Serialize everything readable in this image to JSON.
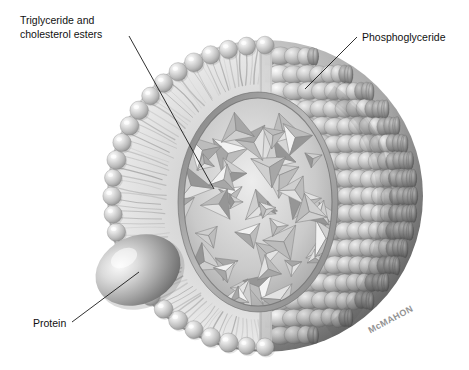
{
  "figure": {
    "background_color": "#ffffff",
    "width": 469,
    "height": 370
  },
  "labels": [
    {
      "id": "triglyceride",
      "name": "triglyceride-and-cholesterol-esters-label",
      "line1": "Triglyceride and",
      "line2": "cholesterol esters",
      "text_x": 20,
      "text_y": 24,
      "line_from_x": 129,
      "line_from_y": 36,
      "line_to_x": 214,
      "line_to_y": 189
    },
    {
      "id": "phosphoglyceride",
      "name": "phosphoglyceride-label",
      "line1": "Phosphoglyceride",
      "line2": "",
      "text_x": 362,
      "text_y": 41,
      "line_from_x": 357,
      "line_from_y": 37,
      "line_to_x": 305,
      "line_to_y": 89
    },
    {
      "id": "protein",
      "name": "protein-label",
      "line1": "Protein",
      "line2": "",
      "text_x": 33,
      "text_y": 327,
      "line_from_x": 72,
      "line_from_y": 322,
      "line_to_x": 139,
      "line_to_y": 272
    }
  ],
  "signature": {
    "text": "McMAHON",
    "x": 392,
    "y": 322,
    "rotation": -28
  },
  "colors": {
    "ink": "#111111",
    "leader_line": "#1a1a1a",
    "signature": "#6f6f6f",
    "surface_light": "#e2e2e2",
    "surface_mid": "#b4b4b4",
    "surface_dark": "#7e7e7e",
    "surface_deep": "#5d5d5d",
    "tail_field": "#d9d9d9",
    "core_fill": "#c9c9c9",
    "core_rim": "#8e8e8e",
    "crystal_light": "#f0f0f0",
    "crystal_mid": "#c4c4c4",
    "crystal_dark": "#939393",
    "protein_light": "#efefef",
    "protein_mid": "#a8a8a8",
    "protein_dark": "#6a6a6a",
    "head_light": "#ededed",
    "head_mid": "#bcbcbc",
    "head_dark": "#8b8b8b"
  },
  "structure": {
    "sphere": {
      "center_x": 265,
      "center_y": 196,
      "radius_x": 158,
      "radius_y": 156,
      "description": "spherical-lipoprotein-particle"
    },
    "core": {
      "center_x": 258,
      "center_y": 202,
      "radius_x": 78,
      "radius_y": 108,
      "description": "hydrophobic-lipid-core"
    },
    "protein": {
      "center_x": 138,
      "center_y": 270,
      "radius_x": 44,
      "radius_y": 34,
      "rotation": -22,
      "description": "apolipoprotein-blob"
    },
    "cut_plane_x": 261,
    "head_count_rim": 26,
    "head_count_surface": 150,
    "tail_count": 78,
    "crystal_count": 46
  }
}
